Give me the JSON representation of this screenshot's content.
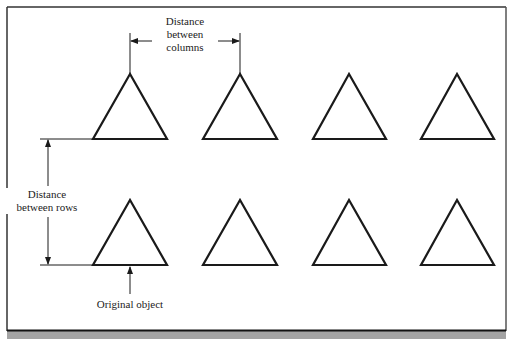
{
  "diagram": {
    "labels": {
      "columns": [
        "Distance",
        "between",
        "columns"
      ],
      "rows": [
        "Distance",
        "between rows"
      ],
      "original": "Original object"
    },
    "array": {
      "rows": 2,
      "columns": 4,
      "shape": "triangle",
      "column_x": [
        130,
        240,
        349,
        457
      ],
      "row_base_y": [
        139,
        265
      ],
      "triangle_height": 65,
      "triangle_half_base": 37
    },
    "colors": {
      "stroke": "#1a1a1a",
      "frame": "#333333",
      "footer_band": "#a3a3a3",
      "background": "#ffffff"
    }
  }
}
